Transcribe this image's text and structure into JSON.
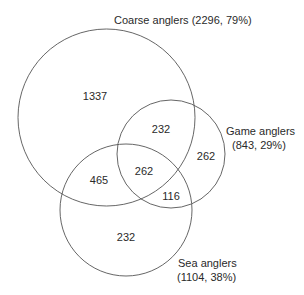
{
  "diagram": {
    "type": "venn",
    "sets": [
      {
        "id": "coarse",
        "label": "Coarse anglers (2296, 79%)",
        "name": "Coarse anglers",
        "count": 2296,
        "percent": "79%"
      },
      {
        "id": "game",
        "label_line1": "Game anglers",
        "label_line2": "(843, 29%)",
        "name": "Game anglers",
        "count": 843,
        "percent": "29%"
      },
      {
        "id": "sea",
        "label_line1": "Sea anglers",
        "label_line2": "(1104, 38%)",
        "name": "Sea anglers",
        "count": 1104,
        "percent": "38%"
      }
    ],
    "regions": {
      "coarse_only": "1337",
      "coarse_game": "232",
      "game_only": "262",
      "coarse_sea": "465",
      "all_three": "262",
      "game_sea": "116",
      "sea_only": "232"
    },
    "stroke_color": "#555555"
  }
}
